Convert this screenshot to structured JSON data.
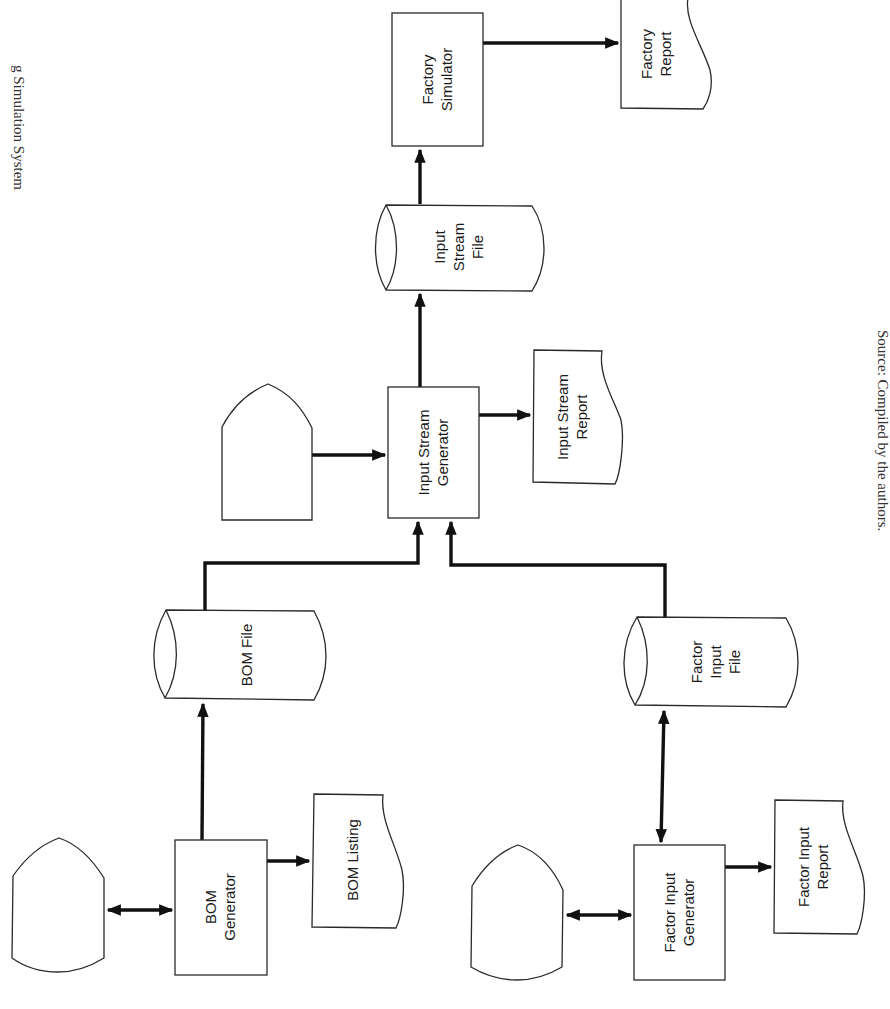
{
  "figure": {
    "title_fragment": "g Simulation System",
    "source_caption": "Source: Compiled by the authors."
  },
  "nodes": {
    "factory_simulator": {
      "type": "process",
      "lines": [
        "Factory",
        "Simulator"
      ]
    },
    "factory_report": {
      "type": "document",
      "lines": [
        "Factory",
        "Report"
      ]
    },
    "input_stream_file": {
      "type": "stored-data",
      "lines": [
        "Input",
        "Stream",
        "File"
      ]
    },
    "input_stream_generator": {
      "type": "process",
      "lines": [
        "Input Stream",
        "Generator"
      ]
    },
    "input_stream_report": {
      "type": "document",
      "lines": [
        "Input Stream",
        "Report"
      ]
    },
    "input_stream_terminal": {
      "type": "display",
      "lines": []
    },
    "bom_file": {
      "type": "stored-data",
      "lines": [
        "BOM File"
      ]
    },
    "bom_generator": {
      "type": "process",
      "lines": [
        "BOM",
        "Generator"
      ]
    },
    "bom_listing": {
      "type": "document",
      "lines": [
        "BOM Listing"
      ]
    },
    "bom_terminal": {
      "type": "display",
      "lines": []
    },
    "factor_input_file": {
      "type": "stored-data",
      "lines": [
        "Factor",
        "Input",
        "File"
      ]
    },
    "factor_input_generator": {
      "type": "process",
      "lines": [
        "Factor Input",
        "Generator"
      ]
    },
    "factor_input_report": {
      "type": "document",
      "lines": [
        "Factor Input",
        "Report"
      ]
    },
    "factor_terminal": {
      "type": "display",
      "lines": []
    }
  },
  "edges": [
    {
      "from": "input_stream_file",
      "to": "factory_simulator",
      "direction": "one-way"
    },
    {
      "from": "factory_simulator",
      "to": "factory_report",
      "direction": "one-way"
    },
    {
      "from": "input_stream_generator",
      "to": "input_stream_file",
      "direction": "one-way"
    },
    {
      "from": "input_stream_generator",
      "to": "input_stream_report",
      "direction": "one-way"
    },
    {
      "from": "input_stream_terminal",
      "to": "input_stream_generator",
      "direction": "one-way"
    },
    {
      "from": "bom_file",
      "to": "input_stream_generator",
      "direction": "one-way"
    },
    {
      "from": "factor_input_file",
      "to": "input_stream_generator",
      "direction": "one-way"
    },
    {
      "from": "bom_generator",
      "to": "bom_file",
      "direction": "one-way"
    },
    {
      "from": "bom_generator",
      "to": "bom_listing",
      "direction": "one-way"
    },
    {
      "from": "bom_terminal",
      "to": "bom_generator",
      "direction": "two-way"
    },
    {
      "from": "factor_input_generator",
      "to": "factor_input_file",
      "direction": "two-way"
    },
    {
      "from": "factor_input_generator",
      "to": "factor_input_report",
      "direction": "one-way"
    },
    {
      "from": "factor_terminal",
      "to": "factor_input_generator",
      "direction": "two-way"
    }
  ],
  "colors": {
    "ink": "#111111",
    "outline": "#2a2a2a",
    "paper": "#ffffff"
  }
}
